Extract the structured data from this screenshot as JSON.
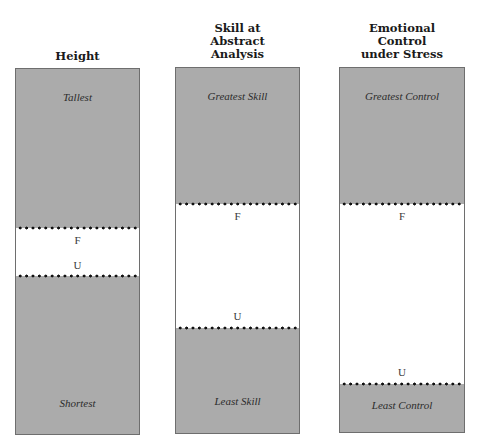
{
  "colors": {
    "shaded": "#ababab",
    "unshaded": "#ffffff",
    "border": "#6e6e6e",
    "dotted_line": "#111111"
  },
  "columns": [
    {
      "title": "Height",
      "top_label": "Tallest",
      "bottom_label": "Shortest",
      "upper_marker": "F",
      "lower_marker": "U"
    },
    {
      "title": "Skill at\nAbstract\nAnalysis",
      "top_label": "Greatest Skill",
      "bottom_label": "Least Skill",
      "upper_marker": "F",
      "lower_marker": "U"
    },
    {
      "title": "Emotional\nControl\nunder Stress",
      "top_label": "Greatest Control",
      "bottom_label": "Least Control",
      "upper_marker": "F",
      "lower_marker": "U"
    }
  ]
}
